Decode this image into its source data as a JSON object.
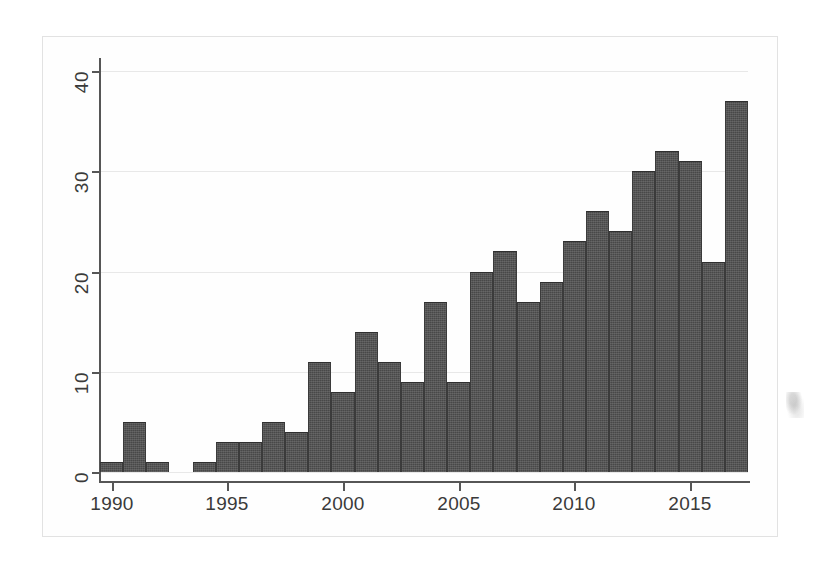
{
  "chart_data": {
    "type": "bar",
    "title": "",
    "subtitle": "",
    "xlabel": "",
    "ylabel": "",
    "xlim": [
      1989.5,
      2017.5
    ],
    "ylim": [
      0,
      41.6
    ],
    "grid": true,
    "legend": null,
    "yticks": [
      0,
      10,
      20,
      30,
      40
    ],
    "ytick_labels": [
      "0",
      "10",
      "20",
      "30",
      "40"
    ],
    "xticks": [
      1990,
      1995,
      2000,
      2005,
      2010,
      2015
    ],
    "xtick_labels": [
      "1990",
      "1995",
      "2000",
      "2005",
      "2010",
      "2015"
    ],
    "categories": [
      "1990",
      "1991",
      "1992",
      "1993",
      "1994",
      "1995",
      "1996",
      "1997",
      "1998",
      "1999",
      "2000",
      "2001",
      "2002",
      "2003",
      "2004",
      "2005",
      "2006",
      "2007",
      "2008",
      "2009",
      "2010",
      "2011",
      "2012",
      "2013",
      "2014",
      "2015",
      "2016",
      "2017"
    ],
    "values": [
      1,
      5,
      1,
      0,
      1,
      3,
      3,
      5,
      4,
      11,
      8,
      14,
      11,
      9,
      17,
      9,
      20,
      22,
      17,
      19,
      23,
      26,
      24,
      30,
      32,
      31,
      21,
      37
    ],
    "bar_color": "#484848",
    "grid_color": "#e8e8e8",
    "axis_color": "#565656",
    "background_color": "#ffffff"
  },
  "figure": {
    "frame_border_color": "#e2e2e2",
    "page_background": "#fefefe"
  }
}
